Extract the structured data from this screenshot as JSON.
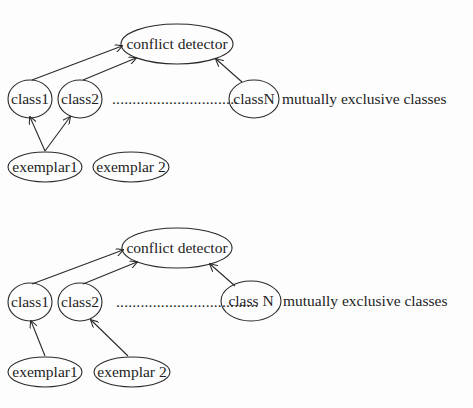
{
  "diagrams": [
    {
      "name": "top-diagram",
      "conflict_detector": "conflict detector",
      "class1": "class1",
      "class2": "class2",
      "ellipsis": "...............................",
      "classN": "classN",
      "annotation": "mutually exclusive classes",
      "exemplar1": "exemplar1",
      "exemplar2": "exemplar 2",
      "edges": [
        {
          "from": "class1",
          "to": "conflict detector"
        },
        {
          "from": "class2",
          "to": "conflict detector"
        },
        {
          "from": "classN",
          "to": "conflict detector"
        },
        {
          "from": "exemplar1",
          "to": "class1"
        },
        {
          "from": "exemplar1",
          "to": "class2"
        }
      ]
    },
    {
      "name": "bottom-diagram",
      "conflict_detector": "conflict detector",
      "class1": "class1",
      "class2": "class2",
      "ellipsis": "...................................",
      "classN": "class N",
      "annotation": "mutually exclusive classes",
      "exemplar1": "exemplar1",
      "exemplar2": "exemplar 2",
      "edges": [
        {
          "from": "class1",
          "to": "conflict detector"
        },
        {
          "from": "class2",
          "to": "conflict detector"
        },
        {
          "from": "class N",
          "to": "conflict detector"
        },
        {
          "from": "exemplar1",
          "to": "class1"
        },
        {
          "from": "exemplar 2",
          "to": "class2"
        }
      ]
    }
  ]
}
